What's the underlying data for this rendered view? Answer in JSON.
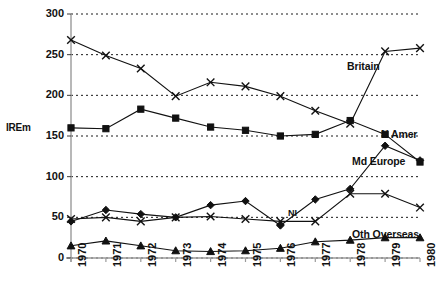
{
  "chart_data": {
    "type": "line",
    "title": "",
    "subtitle": "",
    "xlabel": "",
    "ylabel": "IR£m",
    "ylabel_display": "IREm",
    "xlim": [
      1970,
      1980
    ],
    "ylim": [
      0,
      300
    ],
    "yticks": [
      0,
      50,
      100,
      150,
      200,
      250,
      300
    ],
    "grid": "horizontal-dotted",
    "legend_position": "inline-right-of-line-ends",
    "x": [
      1970,
      1971,
      1972,
      1973,
      1974,
      1975,
      1976,
      1977,
      1978,
      1979,
      1980
    ],
    "categories": [
      "1970",
      "1971",
      "1972",
      "1973",
      "1974",
      "1975",
      "1976",
      "1977",
      "1978",
      "1979",
      "1980"
    ],
    "series": [
      {
        "name": "Britain",
        "marker": "cross",
        "label": "Britain",
        "values": [
          268,
          249,
          233,
          199,
          216,
          211,
          199,
          181,
          165,
          254,
          258
        ]
      },
      {
        "name": "N Amer",
        "marker": "square",
        "label": "N Amer",
        "values": [
          160,
          159,
          183,
          172,
          161,
          157,
          150,
          152,
          169,
          152,
          118
        ]
      },
      {
        "name": "Md Europe",
        "marker": "diamond",
        "label": "Md Europe",
        "values": [
          45,
          59,
          54,
          50,
          65,
          70,
          40,
          72,
          85,
          138,
          120
        ]
      },
      {
        "name": "NI",
        "marker": "cross",
        "label": "NI",
        "values": [
          48,
          50,
          45,
          50,
          51,
          48,
          45,
          45,
          79,
          79,
          62
        ]
      },
      {
        "name": "Oth Overseas",
        "marker": "triangle",
        "label": "Oth Overseas",
        "values": [
          15,
          21,
          15,
          9,
          8,
          9,
          12,
          20,
          22,
          25,
          25
        ]
      }
    ]
  }
}
